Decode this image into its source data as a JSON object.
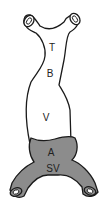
{
  "diagram": {
    "labels": {
      "truncus": "T",
      "bulbus": "B",
      "ventricle": "V",
      "atrium": "A",
      "sinus_venosus": "SV"
    },
    "colors": {
      "outline": "#1a1a1a",
      "upper_fill": "#ffffff",
      "lower_fill": "#8c8c8c",
      "background": "#ffffff"
    }
  }
}
